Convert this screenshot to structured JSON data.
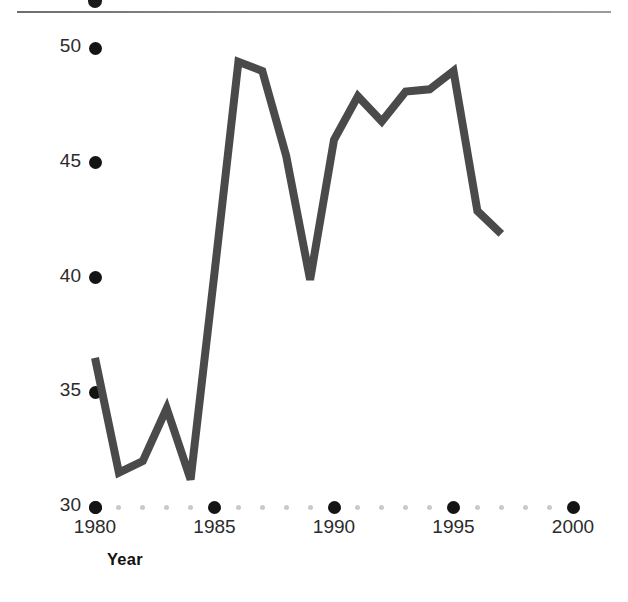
{
  "figure": {
    "has_top_rule": true,
    "top_rule_color": "#8a8a8a",
    "background": "#ffffff"
  },
  "axis_labels": {
    "y_title": "Producer subsidy equivalent (percentage)",
    "x_title": "Year"
  },
  "chart_data": {
    "type": "line",
    "title": "",
    "subtitle": "",
    "xlabel": "Year",
    "ylabel": "Producer subsidy equivalent (percentage)",
    "xlim": [
      1980,
      2000
    ],
    "ylim": [
      30,
      50
    ],
    "xticks": [
      1980,
      1985,
      1990,
      1995,
      2000
    ],
    "xticklabels": [
      "1980",
      "1985",
      "1990",
      "1995",
      "2000"
    ],
    "xminorticks": [
      1981,
      1982,
      1983,
      1984,
      1986,
      1987,
      1988,
      1989,
      1991,
      1992,
      1993,
      1994,
      1996,
      1997,
      1998,
      1999
    ],
    "yticks": [
      30,
      35,
      40,
      45,
      50
    ],
    "yticklabels": [
      "30",
      "35",
      "40",
      "45",
      "50"
    ],
    "grid": false,
    "legend": false,
    "legend_position": "none",
    "line_color": "#4a4a4a",
    "line_width": 8,
    "tick_marker_style": "dot",
    "major_tick_color": "#141414",
    "minor_tick_color": "#c9c9c9",
    "x": [
      1980,
      1981,
      1982,
      1983,
      1984,
      1985,
      1986,
      1987,
      1988,
      1989,
      1990,
      1991,
      1992,
      1993,
      1994,
      1995,
      1996,
      1997
    ],
    "values": [
      36.5,
      31.5,
      32.0,
      34.3,
      31.2,
      40.2,
      49.4,
      49.0,
      45.3,
      39.9,
      46.0,
      47.9,
      46.8,
      48.1,
      48.2,
      49.0,
      42.9,
      41.9
    ],
    "series": [
      {
        "name": "Producer subsidy equivalent",
        "x": [
          1980,
          1981,
          1982,
          1983,
          1984,
          1985,
          1986,
          1987,
          1988,
          1989,
          1990,
          1991,
          1992,
          1993,
          1994,
          1995,
          1996,
          1997
        ],
        "values": [
          36.5,
          31.5,
          32.0,
          34.3,
          31.2,
          40.2,
          49.4,
          49.0,
          45.3,
          39.9,
          46.0,
          47.9,
          46.8,
          48.1,
          48.2,
          49.0,
          42.9,
          41.9
        ]
      }
    ],
    "annotations": []
  }
}
